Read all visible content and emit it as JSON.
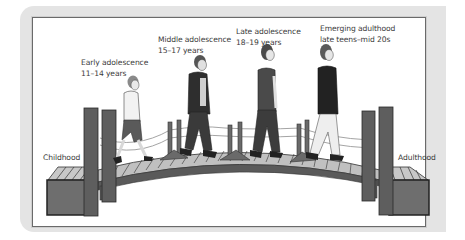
{
  "figure": {
    "endpoints": {
      "start": "Childhood",
      "end": "Adulthood"
    },
    "stages": [
      {
        "name": "Early adolescence",
        "ages": "11–14 years"
      },
      {
        "name": "Middle adolescence",
        "ages": "15–17 years"
      },
      {
        "name": "Late adolescence",
        "ages": "18–19 years"
      },
      {
        "name": "Emerging adulthood",
        "ages": "late teens–mid 20s"
      }
    ],
    "colors": {
      "panel": "#e4e4e4",
      "frame_border": "#6a6a6a",
      "bridge_dark": "#4a4a4a",
      "bridge_mid": "#7a7a7a",
      "plank_light": "#c8c8c8",
      "text": "#3a3a3a"
    }
  }
}
